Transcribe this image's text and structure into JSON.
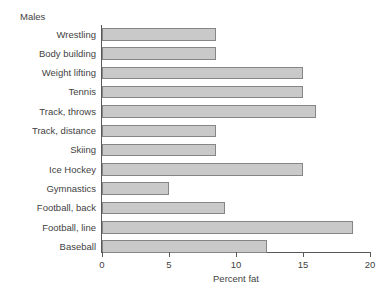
{
  "panel": {
    "title": "Males"
  },
  "chart_data": {
    "type": "bar",
    "orientation": "horizontal",
    "title": "Males",
    "xlabel": "Percent fat",
    "ylabel": "",
    "xlim": [
      0,
      20
    ],
    "xticks": [
      0,
      5,
      10,
      15,
      20
    ],
    "xtick_labels": [
      "0",
      "5",
      "10",
      "15",
      "20"
    ],
    "grid": false,
    "legend": false,
    "bar_fill_color": "#c9c9c9",
    "bar_edge_color": "#868686",
    "axis_color": "#595959",
    "text_color": "#3f3f3f",
    "background_color": "#ffffff",
    "categories": [
      "Wrestling",
      "Body building",
      "Weight lifting",
      "Tennis",
      "Track, throws",
      "Track, distance",
      "Skiing",
      "Ice Hockey",
      "Gymnastics",
      "Football, back",
      "Football, line",
      "Baseball"
    ],
    "values": [
      8.5,
      8.5,
      15.0,
      15.0,
      16.0,
      8.5,
      8.5,
      15.0,
      5.0,
      9.2,
      18.7,
      12.3
    ]
  }
}
